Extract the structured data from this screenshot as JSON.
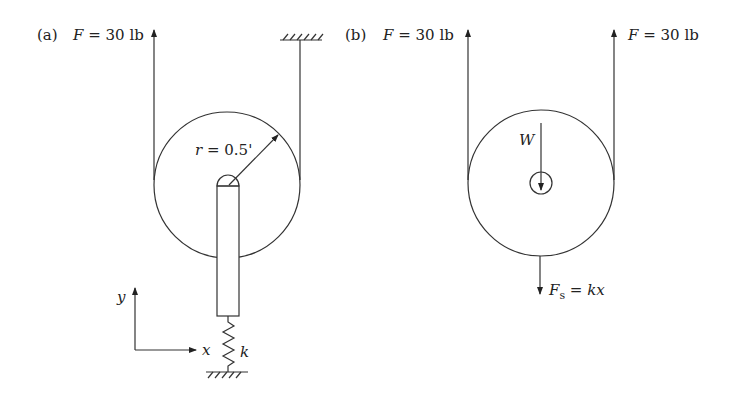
{
  "panel_a": {
    "label": "(a)",
    "force_label": "F = 30 lb",
    "radius_label": "r = 0.5'",
    "axis_y": "y",
    "axis_x": "x",
    "spring_label": "k"
  },
  "panel_b": {
    "label": "(b)",
    "force_left_label": "F = 30 lb",
    "force_right_label": "F = 30 lb",
    "weight_label": "W",
    "spring_force_label": "F",
    "spring_force_sub": "s",
    "spring_force_rhs": "= kx"
  }
}
